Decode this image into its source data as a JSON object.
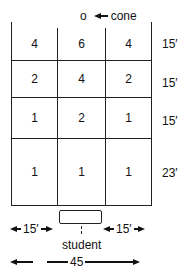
{
  "diagram": {
    "cone": {
      "marker": "o",
      "label": "cone"
    },
    "grid": {
      "rows": [
        {
          "values": [
            "4",
            "6",
            "4"
          ],
          "length_label": "15′"
        },
        {
          "values": [
            "2",
            "4",
            "2"
          ],
          "length_label": "15′"
        },
        {
          "values": [
            "1",
            "2",
            "1"
          ],
          "length_label": "15′"
        },
        {
          "values": [
            "1",
            "1",
            "1"
          ],
          "length_label": "23′"
        }
      ]
    },
    "student": {
      "label": "student"
    },
    "dimensions": {
      "left_column": "15′",
      "right_column": "15′",
      "total_width": "45"
    }
  }
}
